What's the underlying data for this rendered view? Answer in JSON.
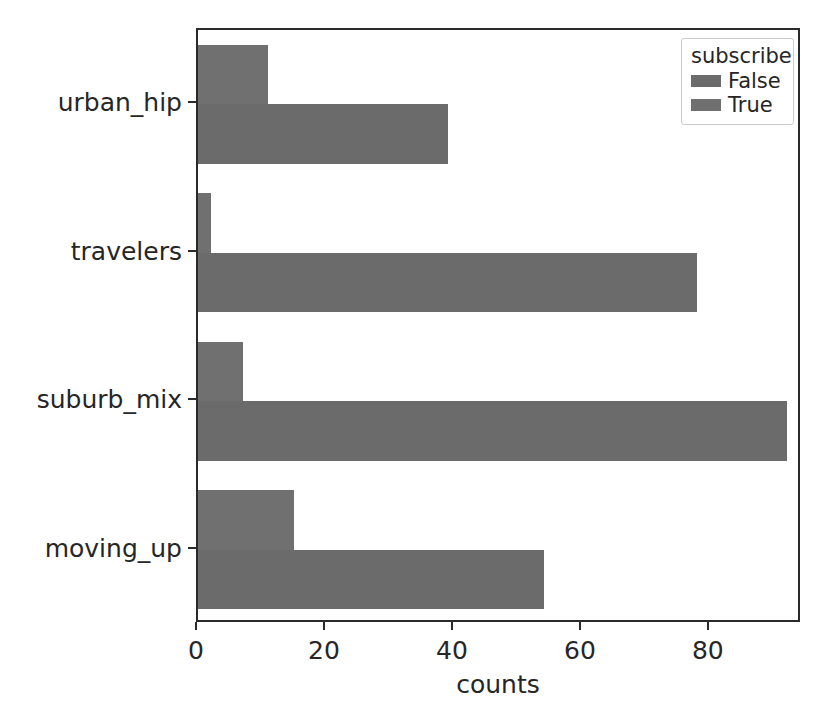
{
  "chart_data": {
    "type": "bar",
    "orientation": "horizontal",
    "title": "",
    "xlabel": "counts",
    "ylabel": "Segment",
    "categories": [
      "urban_hip",
      "travelers",
      "suburb_mix",
      "moving_up"
    ],
    "series": [
      {
        "name": "False",
        "color": "#6b6b6b",
        "values": [
          39,
          78,
          92,
          54
        ]
      },
      {
        "name": "True",
        "color": "#707070",
        "values": [
          11,
          2,
          7,
          15
        ]
      }
    ],
    "legend": {
      "title": "subscribe",
      "position": "upper right",
      "entries": [
        "False",
        "True"
      ]
    },
    "xlim": [
      0,
      94.4
    ],
    "xticks": [
      0,
      20,
      40,
      60,
      80
    ],
    "xtick_labels": [
      "0",
      "20",
      "40",
      "60",
      "80"
    ],
    "grid": false,
    "background": "#ffffff",
    "axis_color": "#2a2a2a"
  }
}
